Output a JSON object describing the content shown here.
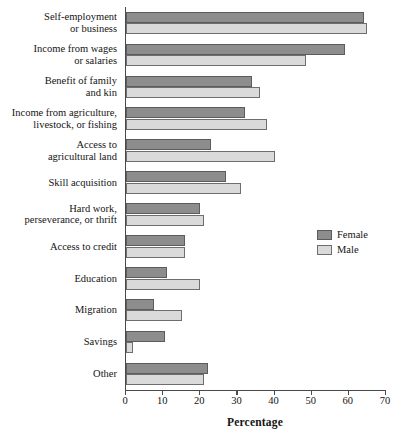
{
  "chart_data": {
    "type": "bar",
    "orientation": "horizontal",
    "title": "",
    "xlabel": "Percentage",
    "ylabel": "",
    "xlim": [
      0,
      70
    ],
    "xticks": [
      0,
      10,
      20,
      30,
      40,
      50,
      60,
      70
    ],
    "grid": false,
    "legend_position": "right",
    "categories": [
      "Self-employment\nor business",
      "Income from wages\nor salaries",
      "Benefit of family\nand kin",
      "Income from agriculture,\nlivestock, or fishing",
      "Access to\nagricultural land",
      "Skill acquisition",
      "Hard work,\nperseverance, or thrift",
      "Access to credit",
      "Education",
      "Migration",
      "Savings",
      "Other"
    ],
    "series": [
      {
        "name": "Female",
        "color": "#8d8d8d",
        "values": [
          64,
          59,
          34,
          32,
          23,
          27,
          20,
          16,
          11,
          7.5,
          10.5,
          22
        ]
      },
      {
        "name": "Male",
        "color": "#dadada",
        "values": [
          65,
          48.5,
          36,
          38,
          40,
          31,
          21,
          16,
          20,
          15,
          2,
          21
        ]
      }
    ]
  },
  "legend": {
    "items": [
      {
        "label": "Female"
      },
      {
        "label": "Male"
      }
    ]
  },
  "axis": {
    "x_title": "Percentage",
    "tick_labels": [
      "0",
      "10",
      "20",
      "30",
      "40",
      "50",
      "60",
      "70"
    ]
  }
}
